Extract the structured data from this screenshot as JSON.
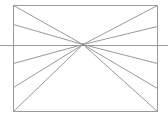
{
  "diagram": {
    "type": "one-point-perspective",
    "width": 168,
    "height": 115,
    "stroke_color": "#9a9a9a",
    "background": "#ffffff",
    "frame": {
      "x1": 13,
      "y1": 5,
      "x2": 157,
      "y2": 111
    },
    "horizon_line": {
      "y": 45,
      "x1": 0,
      "x2": 168
    },
    "vanishing_point": {
      "x": 83,
      "y": 44
    },
    "left_edge_hits_y": [
      5,
      24,
      63,
      87,
      111
    ],
    "right_edge_hits_y": [
      5,
      26,
      63,
      88,
      111
    ]
  }
}
